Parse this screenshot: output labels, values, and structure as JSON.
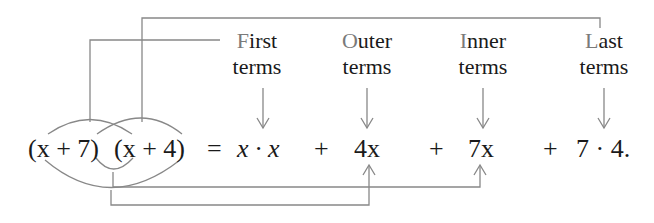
{
  "diagram": {
    "colors": {
      "text": "#1a1a1a",
      "initial": "#7a7a7a",
      "lines": "#888888"
    },
    "labels": [
      {
        "initial": "F",
        "rest": "irst",
        "second": "terms"
      },
      {
        "initial": "O",
        "rest": "uter",
        "second": "terms"
      },
      {
        "initial": "I",
        "rest": "nner",
        "second": "terms"
      },
      {
        "initial": "L",
        "rest": "ast",
        "second": "terms"
      }
    ],
    "equation": {
      "lhs_factor1": "(x + 7)",
      "lhs_factor2": "(x + 4)",
      "equals": "=",
      "term_first": "x · x",
      "plus1": "+",
      "term_outer": "4x",
      "plus2": "+",
      "term_inner": "7x",
      "plus3": "+",
      "term_last": "7 · 4."
    }
  }
}
